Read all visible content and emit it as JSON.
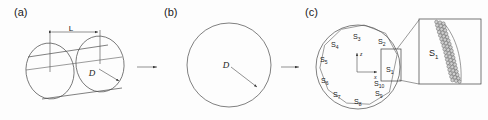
{
  "figure": {
    "background_color": "#fdfdfd",
    "line_color": "#4a4a4a",
    "text_color": "#1a1a1a",
    "particle_fill": "#cfcfcf"
  },
  "panels": [
    {
      "id": "a",
      "label": "(a)",
      "description": "cylinder-3d",
      "dimensions": [
        {
          "name": "length",
          "label": "L"
        },
        {
          "name": "diameter",
          "label": "D"
        }
      ]
    },
    {
      "id": "b",
      "label": "(b)",
      "description": "circular-cross-section",
      "dimensions": [
        {
          "name": "diameter",
          "label": "D"
        }
      ]
    },
    {
      "id": "c",
      "label": "(c)",
      "description": "segmented-cross-section",
      "axes": {
        "vertical": "z",
        "horizontal": "x"
      },
      "segments": [
        {
          "id": "S1",
          "base": "S",
          "sub": "1"
        },
        {
          "id": "S2",
          "base": "S",
          "sub": "2"
        },
        {
          "id": "S3",
          "base": "S",
          "sub": "3"
        },
        {
          "id": "S4",
          "base": "S",
          "sub": "4"
        },
        {
          "id": "S5",
          "base": "S",
          "sub": "5"
        },
        {
          "id": "S6",
          "base": "S",
          "sub": "6"
        },
        {
          "id": "S7",
          "base": "S",
          "sub": "7"
        },
        {
          "id": "S8",
          "base": "S",
          "sub": "8"
        },
        {
          "id": "S9",
          "base": "S",
          "sub": "9"
        },
        {
          "id": "S10",
          "base": "S",
          "sub": "10"
        }
      ],
      "inset": {
        "label_base": "S",
        "label_sub": "1",
        "description": "magnified-particle-discretization"
      }
    }
  ],
  "flow_arrows": [
    {
      "id": "arrow-a-to-b",
      "direction": "right"
    },
    {
      "id": "arrow-b-to-c",
      "direction": "right"
    }
  ]
}
